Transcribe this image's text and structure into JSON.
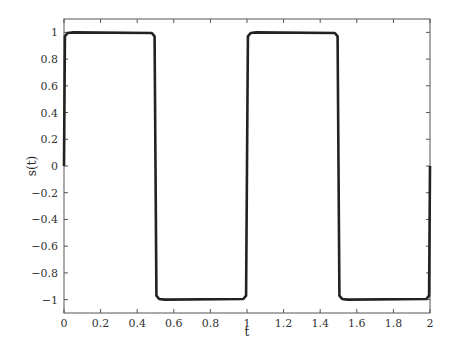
{
  "chart_data": {
    "type": "line",
    "title": "",
    "xlabel": "t",
    "ylabel": "s(t)",
    "xlim": [
      0,
      2
    ],
    "ylim": [
      -1.1,
      1.1
    ],
    "xticks": [
      0,
      0.2,
      0.4,
      0.6,
      0.8,
      1,
      1.2,
      1.4,
      1.6,
      1.8,
      2
    ],
    "xtick_labels": [
      "0",
      "0.2",
      "0.4",
      "0.6",
      "0.8",
      "1",
      "1.2",
      "1.4",
      "1.6",
      "1.8",
      "2"
    ],
    "yticks": [
      1,
      0.8,
      0.6,
      0.4,
      0.2,
      0,
      -0.2,
      -0.4,
      -0.6,
      -0.8,
      -1
    ],
    "ytick_labels": [
      "1",
      "0.8",
      "0.6",
      "0.4",
      "0.2",
      "0",
      "−0.2",
      "−0.4",
      "−0.6",
      "−0.8",
      "−1"
    ],
    "grid": false,
    "legend": null,
    "series": [
      {
        "name": "s(t)",
        "description": "Square wave with period 1, amplitude 1, slightly rounded (Fourier-approximated) edges",
        "color": "#222222",
        "x": [
          0,
          0.005,
          0.02,
          0.05,
          0.48,
          0.495,
          0.5,
          0.505,
          0.52,
          0.55,
          0.98,
          0.995,
          1.0,
          1.005,
          1.02,
          1.05,
          1.48,
          1.495,
          1.5,
          1.505,
          1.52,
          1.55,
          1.98,
          1.995,
          2.0
        ],
        "y": [
          0,
          0.97,
          0.995,
          1,
          0.995,
          0.97,
          0,
          -0.97,
          -0.995,
          -1,
          -0.995,
          -0.97,
          0,
          0.97,
          0.995,
          1,
          0.995,
          0.97,
          0,
          -0.97,
          -0.995,
          -1,
          -0.995,
          -0.97,
          0
        ]
      }
    ]
  }
}
